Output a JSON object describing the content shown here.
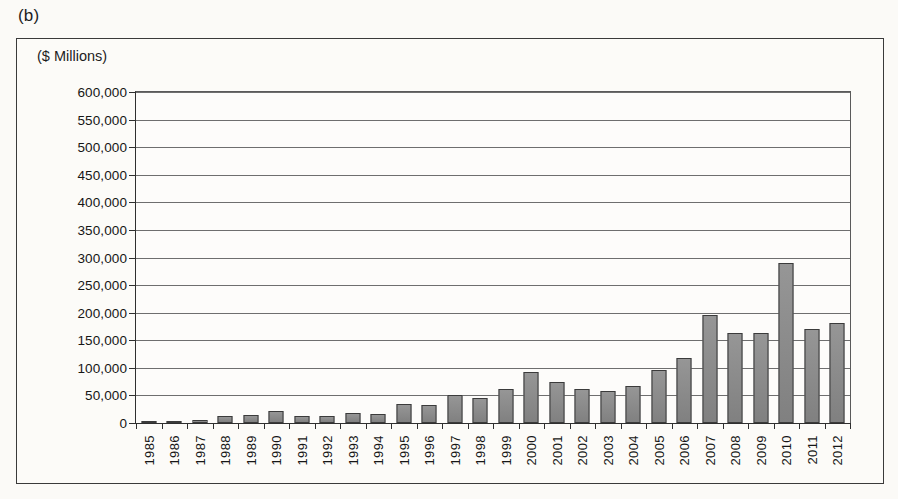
{
  "figure": {
    "panel_label": "(b)",
    "unit_label": "($ Millions)"
  },
  "chart_data": {
    "type": "bar",
    "title": "",
    "subtitle": "",
    "xlabel": "",
    "ylabel": "($ Millions)",
    "ylim": [
      0,
      600000
    ],
    "ytick_step": 50000,
    "ytick_labels": [
      "600,000",
      "550,000",
      "500,000",
      "450,000",
      "400,000",
      "350,000",
      "300,000",
      "250,000",
      "200,000",
      "150,000",
      "100,000",
      "50,000",
      "0"
    ],
    "ytick_values": [
      600000,
      550000,
      500000,
      450000,
      400000,
      350000,
      300000,
      250000,
      200000,
      150000,
      100000,
      50000,
      0
    ],
    "grid": true,
    "legend": "none",
    "bar_color": "#8a8a8a",
    "bar_edge_color": "#3b3b3b",
    "categories": [
      "1985",
      "1986",
      "1987",
      "1988",
      "1989",
      "1990",
      "1991",
      "1992",
      "1993",
      "1994",
      "1995",
      "1996",
      "1997",
      "1998",
      "1999",
      "2000",
      "2001",
      "2002",
      "2003",
      "2004",
      "2005",
      "2006",
      "2007",
      "2008",
      "2009",
      "2010",
      "2011",
      "2012"
    ],
    "values": [
      500,
      1500,
      6000,
      12000,
      14000,
      21000,
      13000,
      12000,
      19000,
      17000,
      35000,
      33000,
      51000,
      46000,
      62000,
      93000,
      74000,
      61000,
      58000,
      68000,
      97000,
      117000,
      196000,
      163000,
      163000,
      290000,
      170000,
      182000
    ]
  }
}
